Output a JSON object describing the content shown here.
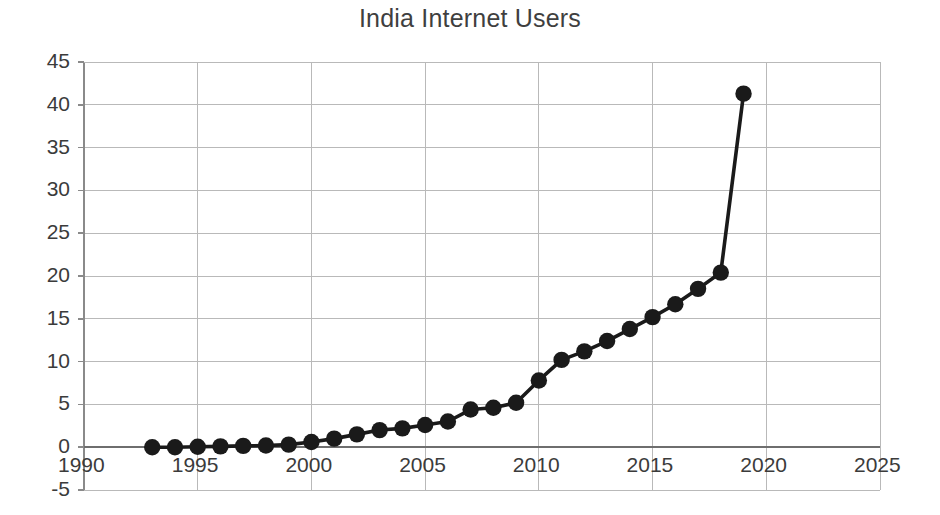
{
  "chart_data": {
    "type": "line",
    "title": "India Internet Users",
    "xlabel": "",
    "ylabel": "",
    "xlim": [
      1990,
      2025
    ],
    "ylim": [
      -5,
      45
    ],
    "grid": true,
    "legend": false,
    "legend_position": "none",
    "xticks": [
      1990,
      1995,
      2000,
      2005,
      2010,
      2015,
      2020,
      2025
    ],
    "yticks": [
      -5,
      0,
      5,
      10,
      15,
      20,
      25,
      30,
      35,
      40,
      45
    ],
    "xtick_labels": [
      "1990",
      "1995",
      "2000",
      "2005",
      "2010",
      "2015",
      "2020",
      "2025"
    ],
    "ytick_labels": [
      "-5",
      "0",
      "5",
      "10",
      "15",
      "20",
      "25",
      "30",
      "35",
      "40",
      "45"
    ],
    "series": [
      {
        "name": "India Internet Users",
        "color": "#1a1a1a",
        "marker": "circle",
        "x": [
          1993,
          1994,
          1995,
          1996,
          1997,
          1998,
          1999,
          2000,
          2001,
          2002,
          2003,
          2004,
          2005,
          2006,
          2007,
          2008,
          2009,
          2010,
          2011,
          2012,
          2013,
          2014,
          2015,
          2016,
          2017,
          2018,
          2019
        ],
        "values": [
          0.0,
          0.0,
          0.05,
          0.1,
          0.15,
          0.2,
          0.3,
          0.6,
          1.0,
          1.5,
          2.0,
          2.2,
          2.6,
          3.0,
          4.4,
          4.6,
          5.2,
          7.8,
          10.2,
          11.2,
          12.4,
          13.8,
          15.2,
          16.7,
          18.5,
          20.4,
          41.3
        ]
      }
    ]
  },
  "axis": {
    "x_axis_name": "year-axis",
    "y_axis_name": "percent-axis"
  }
}
